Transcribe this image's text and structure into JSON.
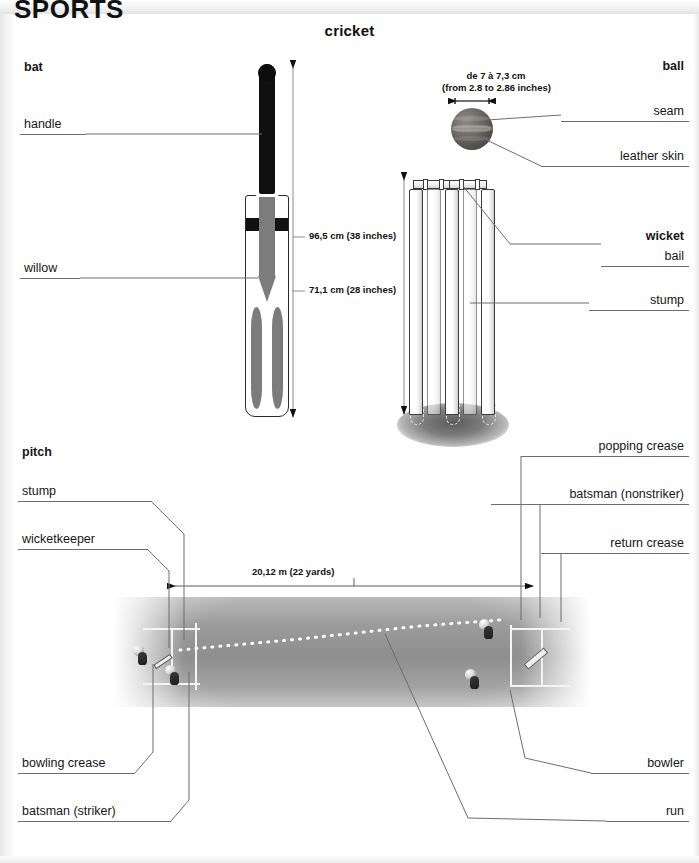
{
  "page": {
    "masthead": "SPORTS",
    "title": "cricket"
  },
  "sections": {
    "bat": "bat",
    "ball": "ball",
    "wicket": "wicket",
    "pitch": "pitch"
  },
  "bat_labels": {
    "handle": "handle",
    "willow": "willow",
    "length_total": "96,5 cm (38 inches)",
    "length_blade": "71,1 cm (28 inches)"
  },
  "ball_labels": {
    "diameter": "de 7 à 7,3 cm",
    "diameter_inches": "(from 2.8 to 2.86 inches)",
    "seam": "seam",
    "leather_skin": "leather skin"
  },
  "wicket_labels": {
    "bail": "bail",
    "stump": "stump"
  },
  "pitch_labels": {
    "stump": "stump",
    "wicketkeeper": "wicketkeeper",
    "bowling_crease": "bowling crease",
    "batsman_striker": "batsman (striker)",
    "popping_crease": "popping crease",
    "batsman_nonstriker": "batsman (nonstriker)",
    "return_crease": "return crease",
    "bowler": "bowler",
    "run": "run",
    "length": "20,12 m (22 yards)"
  },
  "colors": {
    "ink": "#161616",
    "leader": "#6d6d6d",
    "turf": "#9b9b9b",
    "crease": "#f4f4f4",
    "bat_handle": "#101010",
    "bat_willow": "#7c7c7c",
    "ball": "#55514e"
  }
}
